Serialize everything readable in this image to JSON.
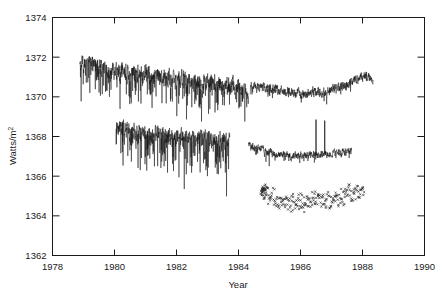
{
  "chart_data": {
    "type": "line",
    "title": "",
    "subtitle": "",
    "xlabel": "Year",
    "ylabel": "Watts/m",
    "ylabel_superscript": "2",
    "xlim": [
      1978,
      1990
    ],
    "ylim": [
      1362,
      1374
    ],
    "x_ticks": [
      1978,
      1980,
      1982,
      1984,
      1986,
      1988,
      1990
    ],
    "x_tick_labels": [
      "1978",
      "1980",
      "1982",
      "1984",
      "1986",
      "1988",
      "1990"
    ],
    "y_ticks": [
      1362,
      1364,
      1366,
      1368,
      1370,
      1372,
      1374
    ],
    "y_tick_labels": [
      "1362",
      "1364",
      "1366",
      "1368",
      "1370",
      "1372",
      "1374"
    ],
    "grid": false,
    "legend": false,
    "tick_direction": "in",
    "frame": "box",
    "line_color": "#111111",
    "marker_color": "#222222",
    "series": [
      {
        "name": "upper-irradiance-series",
        "type": "line",
        "x_start": 1978.88,
        "x_end": 1988.35,
        "color": "#111111",
        "linewidth": 0.5,
        "segments": [
          {
            "x_start": 1978.88,
            "x_end": 1984.32,
            "baseline": [
              [
                1978.88,
                1371.55
              ],
              [
                1979.1,
                1371.85
              ],
              [
                1979.3,
                1371.6
              ],
              [
                1979.55,
                1371.45
              ],
              [
                1979.8,
                1371.3
              ],
              [
                1980.05,
                1371.25
              ],
              [
                1980.35,
                1371.3
              ],
              [
                1980.65,
                1371.1
              ],
              [
                1980.95,
                1371.25
              ],
              [
                1981.25,
                1371.0
              ],
              [
                1981.55,
                1371.05
              ],
              [
                1981.85,
                1370.85
              ],
              [
                1982.15,
                1370.95
              ],
              [
                1982.45,
                1370.75
              ],
              [
                1982.75,
                1370.8
              ],
              [
                1983.05,
                1370.75
              ],
              [
                1983.35,
                1370.7
              ],
              [
                1983.65,
                1370.6
              ],
              [
                1983.95,
                1370.55
              ],
              [
                1984.15,
                1370.4
              ],
              [
                1984.32,
                1370.15
              ]
            ],
            "noise_amplitude": 0.5,
            "dip_amplitude": 1.6,
            "dip_rate": 0.3
          },
          {
            "x_start": 1984.38,
            "x_end": 1988.35,
            "baseline": [
              [
                1984.38,
                1370.55
              ],
              [
                1984.7,
                1370.5
              ],
              [
                1985.05,
                1370.4
              ],
              [
                1985.4,
                1370.3
              ],
              [
                1985.75,
                1370.2
              ],
              [
                1986.1,
                1370.15
              ],
              [
                1986.45,
                1370.25
              ],
              [
                1986.8,
                1370.2
              ],
              [
                1987.1,
                1370.4
              ],
              [
                1987.45,
                1370.6
              ],
              [
                1987.8,
                1370.9
              ],
              [
                1988.1,
                1371.05
              ],
              [
                1988.35,
                1370.95
              ]
            ],
            "noise_amplitude": 0.28,
            "dip_amplitude": 0.55,
            "dip_rate": 0.12
          }
        ]
      },
      {
        "name": "middle-irradiance-series",
        "type": "line",
        "x_start": 1980.05,
        "x_end": 1987.65,
        "color": "#111111",
        "linewidth": 0.5,
        "segments": [
          {
            "x_start": 1980.05,
            "x_end": 1983.72,
            "baseline": [
              [
                1980.05,
                1368.45
              ],
              [
                1980.3,
                1368.5
              ],
              [
                1980.55,
                1368.3
              ],
              [
                1980.85,
                1368.25
              ],
              [
                1981.15,
                1368.05
              ],
              [
                1981.45,
                1368.15
              ],
              [
                1981.75,
                1368.0
              ],
              [
                1982.05,
                1368.1
              ],
              [
                1982.35,
                1367.95
              ],
              [
                1982.65,
                1367.9
              ],
              [
                1982.95,
                1368.0
              ],
              [
                1983.25,
                1367.9
              ],
              [
                1983.5,
                1367.85
              ],
              [
                1983.72,
                1367.9
              ]
            ],
            "noise_amplitude": 0.45,
            "dip_amplitude": 2.0,
            "dip_rate": 0.32
          },
          {
            "x_start": 1984.32,
            "x_end": 1987.65,
            "baseline": [
              [
                1984.32,
                1367.55
              ],
              [
                1984.6,
                1367.4
              ],
              [
                1984.95,
                1367.25
              ],
              [
                1985.3,
                1367.1
              ],
              [
                1985.65,
                1367.05
              ],
              [
                1986.0,
                1367.05
              ],
              [
                1986.35,
                1367.1
              ],
              [
                1986.7,
                1367.1
              ],
              [
                1987.0,
                1367.15
              ],
              [
                1987.3,
                1367.2
              ],
              [
                1987.65,
                1367.3
              ]
            ],
            "noise_amplitude": 0.22,
            "dip_amplitude": 0.45,
            "dip_rate": 0.14,
            "spikes": [
              {
                "x": 1986.5,
                "y": 1368.85
              },
              {
                "x": 1986.78,
                "y": 1368.8
              }
            ]
          }
        ]
      },
      {
        "name": "scatter-irradiance-series",
        "type": "scatter",
        "x_start": 1984.72,
        "x_end": 1988.05,
        "color": "#222222",
        "marker": "x",
        "marker_size": 2,
        "baseline": [
          [
            1984.72,
            1365.3
          ],
          [
            1985.0,
            1365.05
          ],
          [
            1985.3,
            1364.85
          ],
          [
            1985.6,
            1364.75
          ],
          [
            1985.9,
            1364.7
          ],
          [
            1986.2,
            1364.75
          ],
          [
            1986.5,
            1364.8
          ],
          [
            1986.8,
            1364.8
          ],
          [
            1987.1,
            1364.9
          ],
          [
            1987.4,
            1365.05
          ],
          [
            1987.7,
            1365.15
          ],
          [
            1988.05,
            1365.25
          ]
        ],
        "scatter_spread": 0.45,
        "point_count": 210
      }
    ]
  },
  "axes": {
    "x_axis_name": "year-axis",
    "y_axis_name": "irradiance-axis"
  }
}
